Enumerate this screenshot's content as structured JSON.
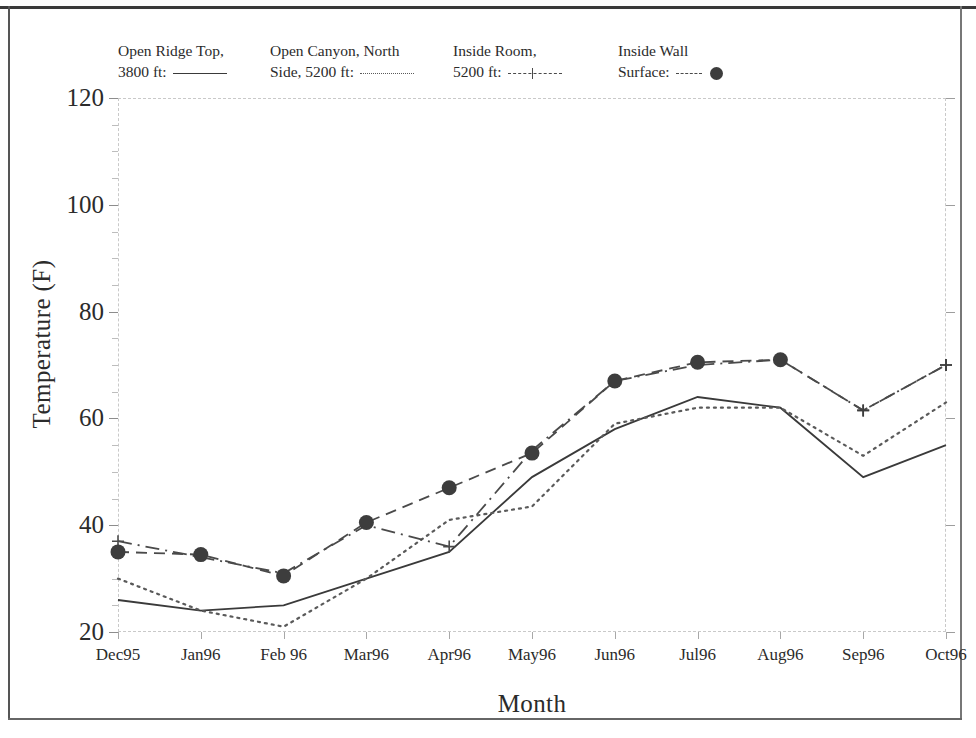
{
  "figure": {
    "background": "#ffffff",
    "ink_color": "#3a3a3a"
  },
  "axes": {
    "ylabel": "Temperature (F)",
    "xlabel": "Month",
    "y_ticks": [
      20,
      40,
      60,
      80,
      100,
      120
    ],
    "y_minor_step": 5,
    "x_ticks": [
      "Dec95",
      "Jan96",
      "Feb 96",
      "Mar96",
      "Apr96",
      "May96",
      "Jun96",
      "Jul96",
      "Aug96",
      "Sep96",
      "Oct96"
    ]
  },
  "legend": {
    "entries": [
      {
        "line1": "Open Ridge Top,",
        "line2": "3800 ft:",
        "style": "solid",
        "marker": "none",
        "color": "#3a3a3a"
      },
      {
        "line1": "Open Canyon, North",
        "line2": "Side, 5200 ft:",
        "style": "dotted",
        "marker": "none",
        "color": "#5a5a5a"
      },
      {
        "line1": "Inside Room,",
        "line2": "5200 ft:",
        "style": "dash-dot",
        "marker": "plus",
        "color": "#4a4a4a"
      },
      {
        "line1": "Inside Wall",
        "line2": "Surface:",
        "style": "dashed",
        "marker": "filled-circle",
        "color": "#4a4a4a"
      }
    ]
  },
  "chart_data": {
    "type": "line",
    "title": "",
    "xlabel": "Month",
    "ylabel": "Temperature (F)",
    "categories": [
      "Dec95",
      "Jan96",
      "Feb 96",
      "Mar96",
      "Apr96",
      "May96",
      "Jun96",
      "Jul96",
      "Aug96",
      "Sep96",
      "Oct96"
    ],
    "ylim": [
      20,
      120
    ],
    "ytick_step": 20,
    "yminor_step": 5,
    "grid": false,
    "legend_position": "top",
    "series": [
      {
        "name": "Open Ridge Top, 3800 ft",
        "style": "solid",
        "marker": "none",
        "color": "#3a3a3a",
        "values": [
          26,
          24,
          25,
          30,
          35,
          49,
          58,
          64,
          62,
          49,
          55
        ]
      },
      {
        "name": "Open Canyon, North Side, 5200 ft",
        "style": "dotted",
        "marker": "none",
        "color": "#5a5a5a",
        "values": [
          30,
          24,
          21,
          30,
          41,
          43.5,
          59,
          62,
          62,
          53,
          63
        ]
      },
      {
        "name": "Inside Room, 5200 ft",
        "style": "dash-dot",
        "marker": "plus",
        "color": "#4a4a4a",
        "values": [
          37,
          34,
          31,
          40,
          36,
          54,
          67,
          70,
          71,
          61.5,
          70
        ]
      },
      {
        "name": "Inside Wall Surface",
        "style": "dashed",
        "marker": "filled-circle",
        "color": "#4a4a4a",
        "values": [
          35,
          34.5,
          30.5,
          40.5,
          47,
          53.5,
          67,
          70.5,
          71,
          61.5,
          70
        ]
      }
    ]
  }
}
